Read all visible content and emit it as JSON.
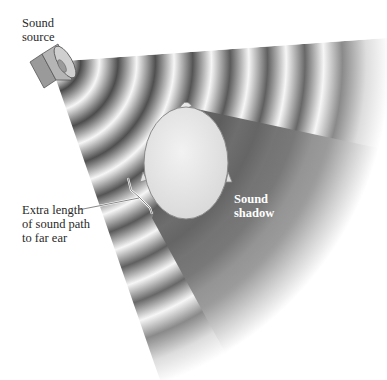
{
  "figure": {
    "type": "diagram",
    "labels": {
      "sound_source": [
        "Sound",
        "source"
      ],
      "sound_shadow": [
        "Sound",
        "shadow"
      ],
      "extra_length": [
        "Extra length",
        "of sound path",
        "to far ear"
      ]
    },
    "elements": {
      "source_icon": "speaker-icon",
      "head_icon": "head-top-view-icon",
      "waves": "concentric-sound-waves",
      "shadow": "shadow-wedge"
    },
    "colors": {
      "background": "#ffffff",
      "wave_dark": "#4a4a4a",
      "wave_light": "#f4f4f4",
      "shadow": "#5a5a5a",
      "head_fill": "#e6e6e6",
      "text": "#2a2a2a",
      "shadow_text": "#ffffff"
    }
  }
}
